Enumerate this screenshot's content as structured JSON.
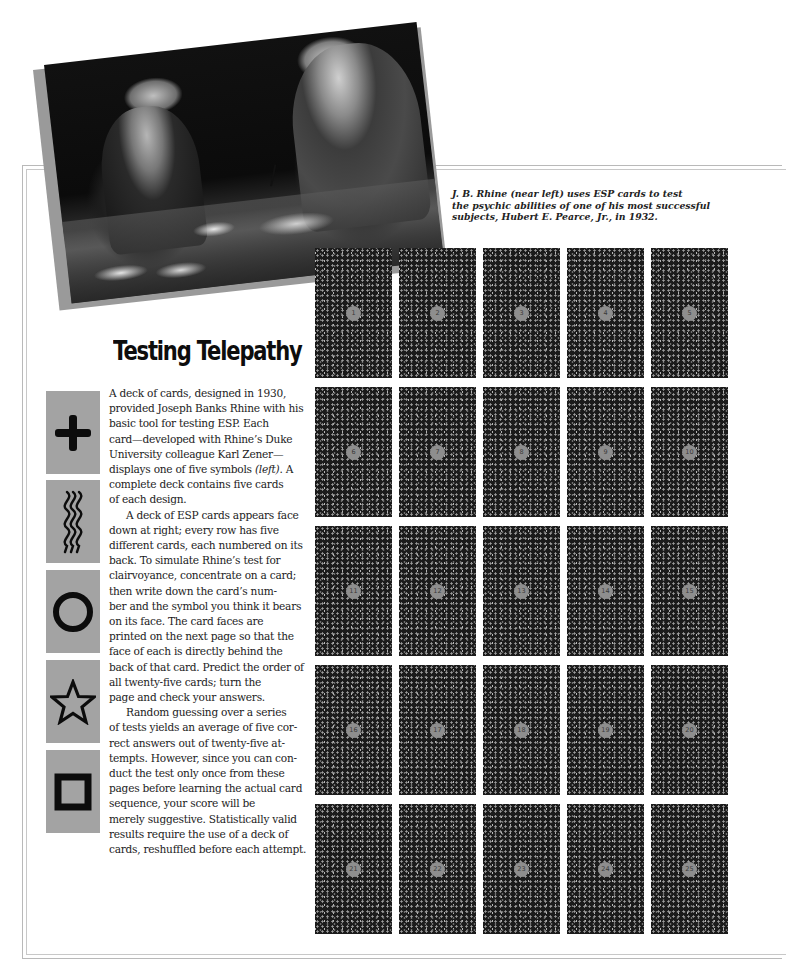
{
  "photo": {
    "description": "Black-and-white photograph of two men at a desk; one writes while the other handles ESP cards"
  },
  "caption": {
    "lines": [
      "J. B. Rhine (near left) uses ESP cards to test",
      "the psychic abilities of one of his most successful",
      "subjects, Hubert E. Pearce, Jr., in 1932."
    ]
  },
  "article": {
    "title": "Testing Telepathy",
    "lines": [
      "A deck of cards, designed in 1930,",
      "provided Joseph Banks Rhine with his",
      "basic tool for testing ESP. Each",
      "card—developed with Rhine’s Duke",
      "University colleague Karl Zener—",
      "displays one of five symbols (left). A",
      "complete deck contains five cards",
      "of each design.",
      "A deck of ESP cards appears face",
      "down at right; every row has five",
      "different cards, each numbered on its",
      "back. To simulate Rhine’s test for",
      "clairvoyance, concentrate on a card;",
      "then write down the card’s num-",
      "ber and the symbol you think it bears",
      "on its face. The card faces are",
      "printed on the next page so that the",
      "face of each is directly behind the",
      "back of that card. Predict the order of",
      "all twenty-five cards; turn the",
      "page and check your answers.",
      "Random guessing over a series",
      "of tests yields an average of five cor-",
      "rect answers out of twenty-five at-",
      "tempts. However, since you can con-",
      "duct the test only once from these",
      "pages before learning the actual card",
      "sequence, your score will be",
      "merely suggestive. Statistically valid",
      "results require the use of a deck of",
      "cards, reshuffled before each attempt."
    ]
  },
  "symbols": [
    {
      "name": "plus",
      "icon": "plus-icon"
    },
    {
      "name": "waves",
      "icon": "wavy-lines-icon"
    },
    {
      "name": "circle",
      "icon": "circle-icon"
    },
    {
      "name": "star",
      "icon": "star-icon"
    },
    {
      "name": "square",
      "icon": "square-icon"
    }
  ],
  "colors": {
    "symbol_card_bg": "#a3a3a3",
    "card_back_bg": "#1b1b1b",
    "number_badge": "#8e8e8e"
  },
  "cards": {
    "numbers": [
      "1",
      "2",
      "3",
      "4",
      "5",
      "6",
      "7",
      "8",
      "9",
      "10",
      "11",
      "12",
      "13",
      "14",
      "15",
      "16",
      "17",
      "18",
      "19",
      "20",
      "21",
      "22",
      "23",
      "24",
      "25"
    ]
  }
}
